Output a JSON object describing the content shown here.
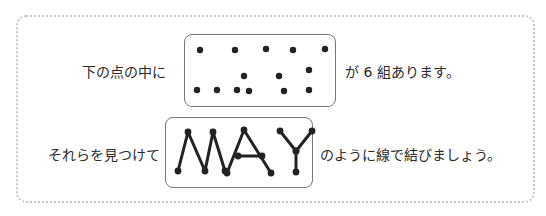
{
  "instruction": {
    "line1_before": "下の点の中に",
    "line1_after": "が 6 組あります。",
    "line2_before": "それらを見つけて",
    "line2_after": "のように線で結びましょう。"
  },
  "puzzle": {
    "group_count": 6,
    "dots": [
      [
        200,
        50
      ],
      [
        235,
        50
      ],
      [
        266,
        49
      ],
      [
        293,
        50
      ],
      [
        325,
        49
      ],
      [
        244,
        76
      ],
      [
        279,
        76
      ],
      [
        309,
        70
      ],
      [
        197,
        90
      ],
      [
        217,
        90
      ],
      [
        237,
        90
      ],
      [
        249,
        91
      ],
      [
        284,
        91
      ],
      [
        309,
        90
      ]
    ]
  },
  "example": {
    "word": "MAY",
    "letters": [
      {
        "letter": "M",
        "points": [
          [
            178,
            171
          ],
          [
            188,
            132
          ],
          [
            205,
            171
          ],
          [
            213,
            132
          ],
          [
            225,
            171
          ]
        ]
      },
      {
        "letter": "A",
        "points": [
          [
            227,
            173
          ],
          [
            244,
            130
          ],
          [
            271,
            173
          ]
        ],
        "crossbar": [
          [
            238,
            156
          ],
          [
            262,
            156
          ]
        ]
      },
      {
        "letter": "Y",
        "points": [
          [
            280,
            131
          ],
          [
            296,
            151
          ],
          [
            312,
            131
          ]
        ],
        "stem": [
          [
            296,
            151
          ],
          [
            296,
            172
          ]
        ]
      }
    ]
  }
}
